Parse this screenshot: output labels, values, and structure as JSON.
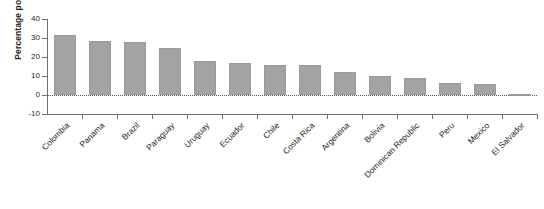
{
  "chart_data": {
    "type": "bar",
    "title": "",
    "subtitle": "",
    "xlabel": "",
    "ylabel": "Percentage points",
    "ylim": [
      -10,
      40
    ],
    "yticks": [
      40,
      30,
      20,
      10,
      0,
      -10
    ],
    "ytick_labels": [
      "40",
      "30",
      "20",
      "10",
      "0",
      "-10"
    ],
    "grid": false,
    "legend": "none",
    "zero_baseline": true,
    "bar_color": "#a3a3a3",
    "axis_color": "#6d6e70",
    "categories": [
      "Colombia",
      "Panama",
      "Brazil",
      "Paraguay",
      "Uruguay",
      "Ecuador",
      "Chile",
      "Costa Rica",
      "Argentina",
      "Bolivia",
      "Dominican Republic",
      "Peru",
      "Mexico",
      "El Salvador"
    ],
    "values": [
      31.5,
      28.5,
      28,
      25,
      18,
      17,
      16,
      16,
      12,
      10,
      9,
      6.5,
      6,
      0.3
    ]
  }
}
